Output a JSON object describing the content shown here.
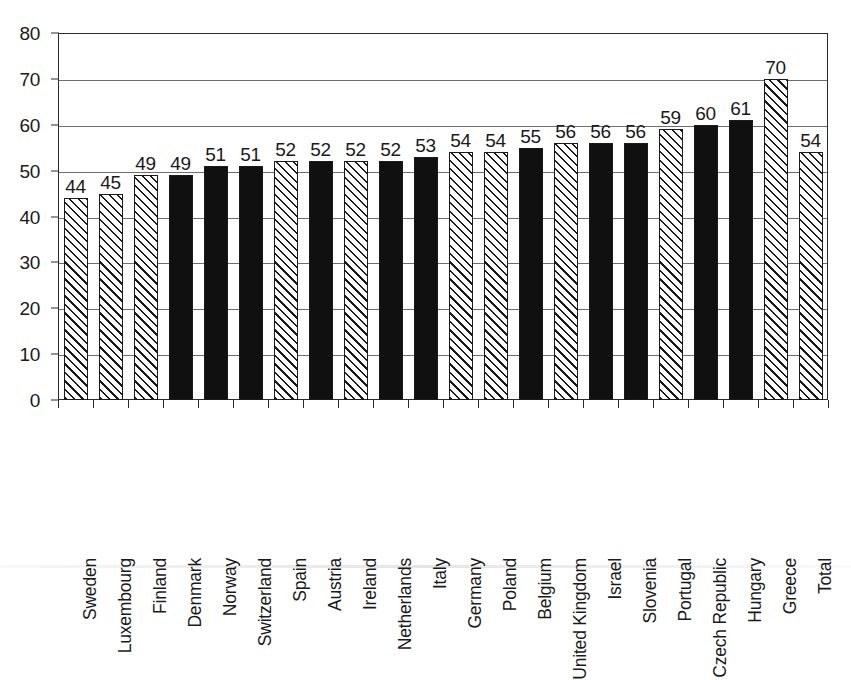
{
  "chart_data": {
    "type": "bar",
    "title": "",
    "subtitle": "",
    "xlabel": "",
    "ylabel": "",
    "ylim": [
      0,
      80
    ],
    "ytick_step": 10,
    "yticks": [
      "0",
      "10",
      "20",
      "30",
      "40",
      "50",
      "60",
      "70",
      "80"
    ],
    "grid": true,
    "legend": "none",
    "categories": [
      "Sweden",
      "Luxembourg",
      "Finland",
      "Denmark",
      "Norway",
      "Switzerland",
      "Spain",
      "Austria",
      "Ireland",
      "Netherlands",
      "Italy",
      "Germany",
      "Poland",
      "Belgium",
      "United Kingdom",
      "Israel",
      "Slovenia",
      "Portugal",
      "Czech Republic",
      "Hungary",
      "Greece",
      "Total"
    ],
    "values": [
      44,
      45,
      49,
      49,
      51,
      51,
      52,
      52,
      52,
      52,
      53,
      54,
      54,
      55,
      56,
      56,
      56,
      59,
      60,
      61,
      70,
      54
    ],
    "data_labels": [
      "44",
      "45",
      "49",
      "49",
      "51",
      "51",
      "52",
      "52",
      "52",
      "52",
      "53",
      "54",
      "54",
      "55",
      "56",
      "56",
      "56",
      "59",
      "60",
      "61",
      "70",
      "54"
    ],
    "bar_fills": [
      "hatched",
      "hatched",
      "hatched",
      "solid",
      "solid",
      "solid",
      "hatched",
      "solid",
      "hatched",
      "solid",
      "solid",
      "hatched",
      "hatched",
      "solid",
      "hatched",
      "solid",
      "solid",
      "hatched",
      "solid",
      "solid",
      "hatched",
      "hatched"
    ],
    "colors": {
      "bar_solid": "#101010",
      "bar_hatch_line": "#1a1a1a",
      "bar_hatch_background": "#ffffff",
      "bar_outline": "#1a1a1a",
      "gridline": "#6e6e6e",
      "axis": "#2b2b2b",
      "text": "#1a1a1a",
      "plot_background": "#ffffff"
    }
  }
}
